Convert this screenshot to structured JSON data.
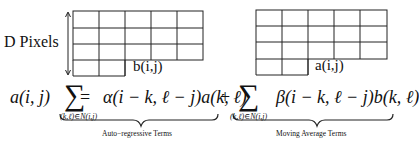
{
  "diagram": {
    "left_grid": {
      "label": "b(i,j)",
      "rows": 4,
      "cols": 5
    },
    "right_grid": {
      "label": "a(i,j)",
      "rows": 4,
      "cols": 5
    },
    "side_label": "D Pixels",
    "equation": {
      "lhs": "a(i, j)",
      "equals": "=",
      "sum_symbol": "∑",
      "sum_subscript": "(k,ℓ)∈N(i,j)",
      "term1": "α(i − k, ℓ − j)a(k, ℓ)",
      "plus": "+",
      "term2": "β(i − k, ℓ − j)b(k, ℓ)",
      "brace1_caption": "Auto−regressive  Terms",
      "brace2_caption": "Moving  Average  Terms"
    }
  }
}
